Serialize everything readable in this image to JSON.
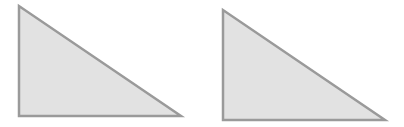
{
  "diagram": {
    "fill_color": "#e2e2e2",
    "stroke_color": "#9a9a9a",
    "stroke_width": 2.5,
    "shapes": [
      {
        "name": "triangle-left",
        "type": "right-triangle",
        "points": [
          [
            19,
            6
          ],
          [
            19,
            116
          ],
          [
            181,
            116
          ]
        ]
      },
      {
        "name": "triangle-right",
        "type": "right-triangle",
        "points": [
          [
            223,
            10
          ],
          [
            223,
            120
          ],
          [
            385,
            120
          ]
        ]
      }
    ]
  }
}
